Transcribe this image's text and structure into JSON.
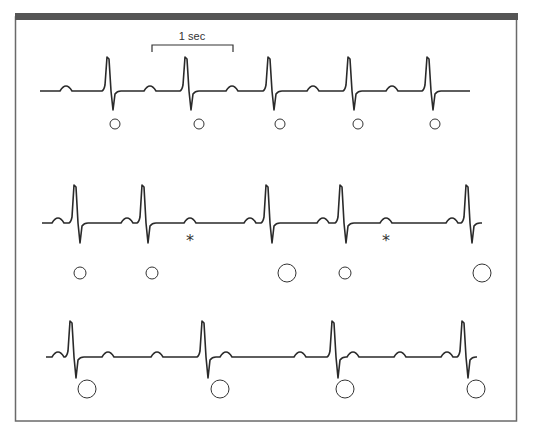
{
  "figure": {
    "scale_bar_label": "1 sec",
    "colors": {
      "trace": "#2a2a2a",
      "frame": "#6a6a6a",
      "top_bar": "#555555",
      "background": "#ffffff"
    },
    "caption_visible": "(partially cropped caption text at bottom edge)"
  },
  "scale_bar": {
    "x1": 152,
    "x2": 233,
    "y": 45,
    "tick": 7,
    "label_x": 192,
    "label_y": 40
  },
  "rows": [
    {
      "name": "row-1-regular-rhythm",
      "baseline": 91,
      "x_start": 40,
      "x_end": 470,
      "qrs": [
        107,
        185,
        268,
        348,
        427
      ],
      "qrs_top": 57,
      "qrs_bottom": 110,
      "p_waves": [
        66,
        150,
        232,
        313,
        392
      ],
      "markers": [
        {
          "type": "circle",
          "x": 115,
          "y": 124,
          "r": 5
        },
        {
          "type": "circle",
          "x": 199,
          "y": 124,
          "r": 5
        },
        {
          "type": "circle",
          "x": 280,
          "y": 124,
          "r": 5
        },
        {
          "type": "circle",
          "x": 358,
          "y": 124,
          "r": 5
        },
        {
          "type": "circle",
          "x": 435,
          "y": 124,
          "r": 5
        }
      ]
    },
    {
      "name": "row-2-dropped-beats",
      "baseline": 223,
      "x_start": 42,
      "x_end": 482,
      "qrs": [
        74,
        142,
        266,
        340,
        466
      ],
      "qrs_top": 185,
      "qrs_bottom": 243,
      "p_waves": [
        58,
        127,
        190,
        250,
        323,
        386,
        452
      ],
      "markers": [
        {
          "type": "circle",
          "x": 80,
          "y": 273,
          "r": 6
        },
        {
          "type": "circle",
          "x": 152,
          "y": 273,
          "r": 6
        },
        {
          "type": "circle",
          "x": 287,
          "y": 273,
          "r": 9
        },
        {
          "type": "circle",
          "x": 345,
          "y": 273,
          "r": 6
        },
        {
          "type": "circle",
          "x": 482,
          "y": 273,
          "r": 9
        },
        {
          "type": "asterisk",
          "x": 190,
          "y": 240,
          "label": "*"
        },
        {
          "type": "asterisk",
          "x": 386,
          "y": 240,
          "label": "*"
        }
      ]
    },
    {
      "name": "row-3-block-rhythm",
      "baseline": 357,
      "x_start": 46,
      "x_end": 477,
      "qrs": [
        70,
        202,
        332,
        462
      ],
      "qrs_top": 321,
      "qrs_bottom": 378,
      "p_waves": [
        58,
        108,
        157,
        226,
        300,
        353,
        400,
        447
      ],
      "markers": [
        {
          "type": "circle",
          "x": 87,
          "y": 389,
          "r": 9
        },
        {
          "type": "circle",
          "x": 220,
          "y": 389,
          "r": 9
        },
        {
          "type": "circle",
          "x": 345,
          "y": 389,
          "r": 9
        },
        {
          "type": "circle",
          "x": 476,
          "y": 389,
          "r": 9
        }
      ]
    }
  ]
}
